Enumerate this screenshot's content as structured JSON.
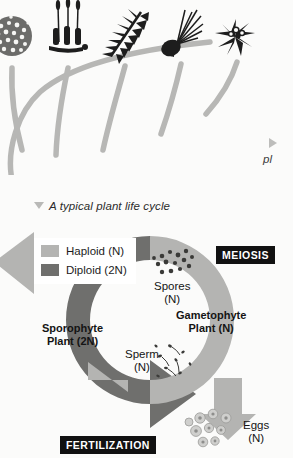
{
  "figure": {
    "caption": "A typical plant life cycle",
    "caption_marker": "triangle-down-marker"
  },
  "edge_callout": {
    "marker": "triangle-right-marker",
    "text_fragment": "pl"
  },
  "phylogeny": {
    "title_visible": false,
    "taxa": [
      {
        "name": "algae",
        "icon": "algae-colony-icon"
      },
      {
        "name": "moss",
        "icon": "moss-sporophyte-icon"
      },
      {
        "name": "fern",
        "icon": "fern-frond-icon"
      },
      {
        "name": "gymnosperm",
        "icon": "conifer-cone-icon"
      },
      {
        "name": "angiosperm",
        "icon": "flowering-plant-icon"
      }
    ],
    "branch_color": "#b7b7b5"
  },
  "legend": {
    "items": [
      {
        "label": "Haploid (N)",
        "color": "#b4b4b2"
      },
      {
        "label": "Diploid (2N)",
        "color": "#6f6f6d"
      }
    ]
  },
  "cycle": {
    "process_labels": [
      {
        "id": "meiosis",
        "text": "MEIOSIS"
      },
      {
        "id": "fertilization",
        "text": "FERTILIZATION"
      }
    ],
    "stage_labels": [
      {
        "id": "spores",
        "line1": "Spores",
        "line2": "(N)",
        "bold": false
      },
      {
        "id": "gametophyte",
        "line1": "Gametophyte",
        "line2": "Plant (N)",
        "bold": true
      },
      {
        "id": "sporophyte",
        "line1": "Sporophyte",
        "line2": "Plant (2N)",
        "bold": true
      },
      {
        "id": "sperm",
        "line1": "Sperm",
        "line2": "(N)",
        "bold": false
      },
      {
        "id": "eggs",
        "line1": "Eggs",
        "line2": "(N)",
        "bold": false
      }
    ],
    "cell_groups": [
      {
        "id": "spores",
        "icon": "spore-cluster-icon",
        "count": 14
      },
      {
        "id": "sperm",
        "icon": "sperm-cluster-icon",
        "count": 9
      },
      {
        "id": "eggs",
        "icon": "egg-cluster-icon",
        "count": 9
      }
    ],
    "colors": {
      "haploid": "#b4b4b2",
      "diploid": "#6f6f6d",
      "label_box": "#111111",
      "label_box_text": "#ffffff",
      "background": "#fbfbfa"
    }
  }
}
